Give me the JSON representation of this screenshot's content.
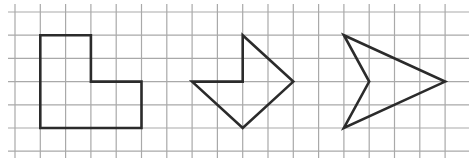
{
  "diagram": {
    "type": "grid-figures",
    "grid": {
      "origin_x": 15,
      "origin_y": 12,
      "step_x": 25.3,
      "step_y": 23.2,
      "columns": 18,
      "rows": 7,
      "extend_left": 8,
      "extend_right": 469,
      "extend_top": 4,
      "extend_bottom": 158,
      "line_color": "#a9a9a9"
    },
    "shape_color": "#2b2b2b",
    "shapes": [
      {
        "name": "l-shape",
        "points_grid": [
          [
            1,
            1
          ],
          [
            3,
            1
          ],
          [
            3,
            3
          ],
          [
            5,
            3
          ],
          [
            5,
            5
          ],
          [
            1,
            5
          ]
        ]
      },
      {
        "name": "arrow-shape",
        "points_grid": [
          [
            9,
            1
          ],
          [
            11,
            3
          ],
          [
            9,
            5
          ],
          [
            7,
            3
          ],
          [
            9,
            3
          ]
        ]
      },
      {
        "name": "dart-shape",
        "points_grid": [
          [
            13,
            1
          ],
          [
            17,
            3
          ],
          [
            13,
            5
          ],
          [
            14,
            3
          ]
        ]
      }
    ]
  }
}
